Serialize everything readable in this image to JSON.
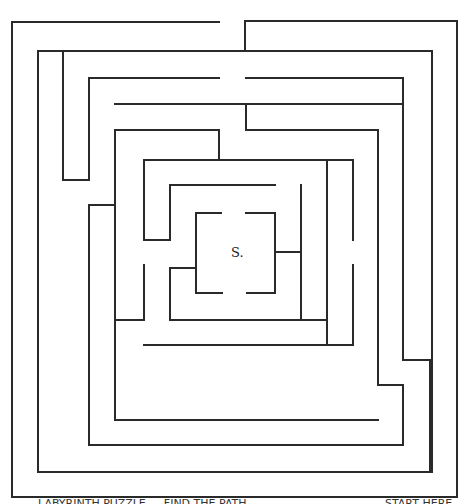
{
  "maze": {
    "stroke_color": "#2a2a2a",
    "background": "#ffffff",
    "start_label": "S.",
    "segments": [
      [
        12,
        22,
        219,
        22
      ],
      [
        245,
        21,
        457,
        21
      ],
      [
        245,
        21,
        245,
        51
      ],
      [
        12,
        22,
        12,
        497
      ],
      [
        12,
        497,
        457,
        497
      ],
      [
        457,
        21,
        457,
        497
      ],
      [
        38,
        51,
        432,
        51
      ],
      [
        38,
        51,
        38,
        472
      ],
      [
        38,
        472,
        432,
        472
      ],
      [
        432,
        51,
        432,
        472
      ],
      [
        63,
        51,
        63,
        180
      ],
      [
        63,
        180,
        89,
        180
      ],
      [
        89,
        78,
        219,
        78
      ],
      [
        246,
        78,
        403,
        78
      ],
      [
        89,
        78,
        89,
        180
      ],
      [
        89,
        205,
        115,
        205
      ],
      [
        89,
        205,
        89,
        445
      ],
      [
        89,
        445,
        403,
        445
      ],
      [
        403,
        78,
        403,
        360
      ],
      [
        403,
        360,
        430,
        360
      ],
      [
        430,
        360,
        430,
        472
      ],
      [
        115,
        104,
        403,
        104
      ],
      [
        115,
        130,
        219,
        130
      ],
      [
        219,
        130,
        219,
        160
      ],
      [
        246,
        104,
        246,
        130
      ],
      [
        246,
        130,
        378,
        130
      ],
      [
        115,
        130,
        115,
        420
      ],
      [
        115,
        420,
        378,
        420
      ],
      [
        378,
        130,
        378,
        385
      ],
      [
        378,
        385,
        403,
        385
      ],
      [
        403,
        385,
        403,
        445
      ],
      [
        144,
        160,
        353,
        160
      ],
      [
        144,
        160,
        144,
        240
      ],
      [
        144,
        240,
        170,
        240
      ],
      [
        353,
        160,
        353,
        240
      ],
      [
        353,
        265,
        353,
        345
      ],
      [
        144,
        265,
        144,
        320
      ],
      [
        144,
        320,
        115,
        320
      ],
      [
        144,
        345,
        353,
        345
      ],
      [
        170,
        185,
        275,
        185
      ],
      [
        170,
        185,
        170,
        240
      ],
      [
        170,
        268,
        196,
        268
      ],
      [
        170,
        268,
        170,
        320
      ],
      [
        170,
        320,
        327,
        320
      ],
      [
        301,
        185,
        301,
        320
      ],
      [
        327,
        160,
        327,
        345
      ],
      [
        196,
        213,
        221,
        213
      ],
      [
        196,
        213,
        196,
        293
      ],
      [
        196,
        293,
        222,
        293
      ],
      [
        246,
        213,
        275,
        213
      ],
      [
        275,
        213,
        275,
        293
      ],
      [
        247,
        293,
        275,
        293
      ],
      [
        275,
        252,
        301,
        252
      ]
    ]
  },
  "captions": {
    "left": "LABYRINTH PUZZLE — FIND THE PATH",
    "right": "START HERE"
  }
}
